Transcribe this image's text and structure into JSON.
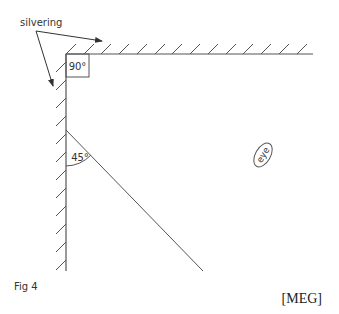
{
  "diagram": {
    "labels": {
      "silvering": "silvering",
      "right_angle": "90°",
      "incidence_angle": "45°",
      "eye": "eye",
      "figure": "Fig 4",
      "source": "[MEG]"
    },
    "colors": {
      "line": "#444444",
      "text": "#333333",
      "background": "#ffffff"
    }
  }
}
